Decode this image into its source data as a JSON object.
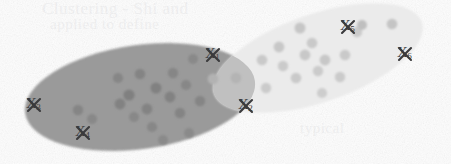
{
  "figure": {
    "caption": "",
    "background_color": "#fdfdfd",
    "paper_bleed_text": {
      "line1": "Clustering - Shi and",
      "line2": "applied to define",
      "line3": "typical"
    },
    "clusters": [
      {
        "id": "cluster-left",
        "name": "dark-cluster",
        "fill_color": "#9a9a9a",
        "cx": 140,
        "cy": 97,
        "rx": 116,
        "ry": 52,
        "rotation": -8,
        "point_color": "#848484",
        "points": [
          [
            78,
            110
          ],
          [
            92,
            119
          ],
          [
            120,
            104
          ],
          [
            118,
            78
          ],
          [
            129,
            95
          ],
          [
            140,
            74
          ],
          [
            147,
            109
          ],
          [
            152,
            127
          ],
          [
            156,
            88
          ],
          [
            134,
            117
          ],
          [
            163,
            140
          ],
          [
            170,
            97
          ],
          [
            173,
            73
          ],
          [
            180,
            113
          ],
          [
            186,
            85
          ],
          [
            193,
            59
          ],
          [
            189,
            133
          ],
          [
            200,
            101
          ]
        ]
      },
      {
        "id": "cluster-right",
        "name": "light-cluster",
        "fill_color": "#ebebeb",
        "cx": 318,
        "cy": 58,
        "rx": 110,
        "ry": 44,
        "rotation": -19,
        "point_color": "#c8c8c8",
        "points": [
          [
            213,
            79
          ],
          [
            236,
            78
          ],
          [
            262,
            60
          ],
          [
            266,
            88
          ],
          [
            279,
            47
          ],
          [
            283,
            66
          ],
          [
            296,
            78
          ],
          [
            300,
            28
          ],
          [
            305,
            55
          ],
          [
            312,
            43
          ],
          [
            318,
            71
          ],
          [
            322,
            93
          ],
          [
            325,
            60
          ],
          [
            340,
            77
          ],
          [
            345,
            55
          ],
          [
            357,
            32
          ],
          [
            362,
            25
          ],
          [
            392,
            24
          ]
        ]
      }
    ],
    "overlap": {
      "name": "cluster-intersection",
      "fill_color": "#bdbdbd"
    },
    "marked_points": [
      {
        "id": "x1",
        "label": "X",
        "subscript": "1",
        "x": 205,
        "y": 46,
        "cross_x": 213,
        "cross_y": 55
      },
      {
        "id": "x2",
        "label": "X",
        "subscript": "2",
        "x": 238,
        "y": 97,
        "cross_x": 246,
        "cross_y": 106
      },
      {
        "id": "x3",
        "label": "X",
        "subscript": "3",
        "x": 26,
        "y": 96,
        "cross_x": 34,
        "cross_y": 105
      },
      {
        "id": "x4",
        "label": "X",
        "subscript": "4",
        "x": 75,
        "y": 124,
        "cross_x": 83,
        "cross_y": 133
      },
      {
        "id": "x5",
        "label": "X",
        "subscript": "5",
        "x": 340,
        "y": 18,
        "cross_x": 348,
        "cross_y": 27
      },
      {
        "id": "x6",
        "label": "X",
        "subscript": "6",
        "x": 397,
        "y": 45,
        "cross_x": 405,
        "cross_y": 54
      }
    ],
    "label_color": "#3a3a3c"
  }
}
